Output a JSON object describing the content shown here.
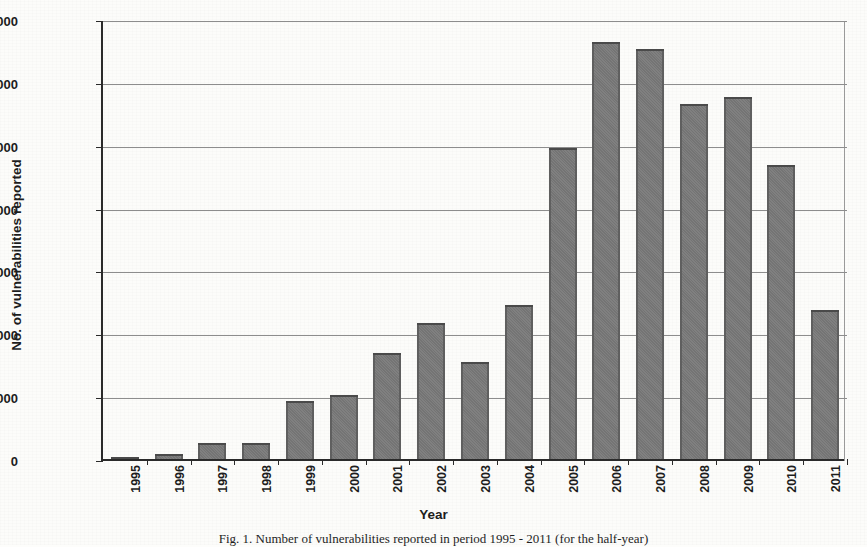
{
  "figure": {
    "caption": "Fig. 1. Number of vulnerabilities reported in period 1995 - 2011 (for the half-year)",
    "background_color": "#fcfcfa",
    "bar_color": "#7b7b7b",
    "bar_border_color": "#4a4a4a",
    "gridline_color": "#8d8d8d",
    "axis_color": "#2a2a2a"
  },
  "chart_data": {
    "type": "bar",
    "title": "",
    "xlabel": "Year",
    "ylabel": "No. of vulnerabilities reported",
    "categories": [
      "1995",
      "1996",
      "1997",
      "1998",
      "1999",
      "2000",
      "2001",
      "2002",
      "2003",
      "2004",
      "2005",
      "2006",
      "2007",
      "2008",
      "2009",
      "2010",
      "2011"
    ],
    "values": [
      25,
      75,
      260,
      255,
      920,
      1015,
      1690,
      2170,
      1540,
      2450,
      4950,
      6630,
      6520,
      5650,
      5760,
      4670,
      2370
    ],
    "ylim": [
      0,
      7000
    ],
    "yticks": [
      0,
      1000,
      2000,
      3000,
      4000,
      5000,
      6000,
      7000
    ],
    "ytick_labels": [
      "0",
      "1000",
      "2000",
      "3000",
      "4000",
      "5000",
      "6000",
      "7000"
    ],
    "grid": true,
    "grid_axis": "y",
    "legend": false,
    "legend_position": "none",
    "xtick_rotation": -90,
    "series": [
      {
        "name": "No. of vulnerabilities reported",
        "values": [
          25,
          75,
          260,
          255,
          920,
          1015,
          1690,
          2170,
          1540,
          2450,
          4950,
          6630,
          6520,
          5650,
          5760,
          4670,
          2370
        ]
      }
    ]
  }
}
